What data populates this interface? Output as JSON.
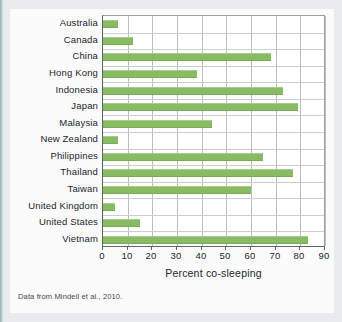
{
  "figure": {
    "source_note": "Data from Mindell et al., 2010.",
    "bar_color": "#88bb63",
    "plot_background": "#ffffff",
    "page_background": "#fbfbfb",
    "gridline_color": "#b9bec1",
    "axis_color": "#5d6468"
  },
  "chart_data": {
    "type": "bar",
    "orientation": "horizontal",
    "title": "",
    "subtitle": "",
    "xlabel": "Percent co-sleeping",
    "ylabel": "",
    "xlim": [
      0,
      90
    ],
    "xticks": [
      0,
      10,
      20,
      30,
      40,
      50,
      60,
      70,
      80,
      90
    ],
    "xtick_labels": [
      "0",
      "10",
      "20",
      "30",
      "40",
      "50",
      "60",
      "70",
      "80",
      "90"
    ],
    "grid": "vertical",
    "legend": "none",
    "categories": [
      "Australia",
      "Canada",
      "China",
      "Hong Kong",
      "Indonesia",
      "Japan",
      "Malaysia",
      "New Zealand",
      "Philippines",
      "Thailand",
      "Taiwan",
      "United Kingdom",
      "United  States",
      "Vietnam"
    ],
    "values": [
      6,
      12,
      68,
      38,
      73,
      79,
      44,
      6,
      65,
      77,
      60,
      5,
      15,
      83
    ],
    "series": [
      {
        "name": "Percent co-sleeping",
        "values": [
          6,
          12,
          68,
          38,
          73,
          79,
          44,
          6,
          65,
          77,
          60,
          5,
          15,
          83
        ]
      }
    ]
  }
}
